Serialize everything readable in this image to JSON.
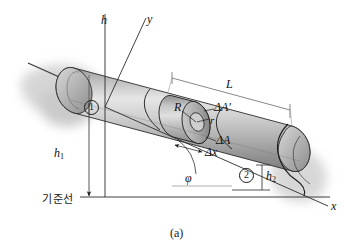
{
  "figure": {
    "caption": "(a)",
    "datum_label": "기준선",
    "axes": {
      "vertical": "h",
      "diagonal": "y",
      "horizontal": "x"
    },
    "labels": {
      "length": "L",
      "outer_radius": "R",
      "inner_radius": "r",
      "area_outer": "ΔA'",
      "area_inner": "ΔA",
      "length_element": "Δx",
      "height_1": "h",
      "height_1_sub": "1",
      "height_2": "h",
      "height_2_sub": "2",
      "angle": "φ",
      "station_1": "1",
      "station_2": "2"
    },
    "colors": {
      "stroke": "#1a1a1a",
      "pipe_light": "#e2e2e2",
      "pipe_mid": "#b9b9b9",
      "pipe_dark": "#8f8f8f",
      "pipe_shadow": "#6f6f6f",
      "band": "#cfcfcf",
      "background": "#ffffff",
      "blur": "#c9c9c9"
    }
  }
}
